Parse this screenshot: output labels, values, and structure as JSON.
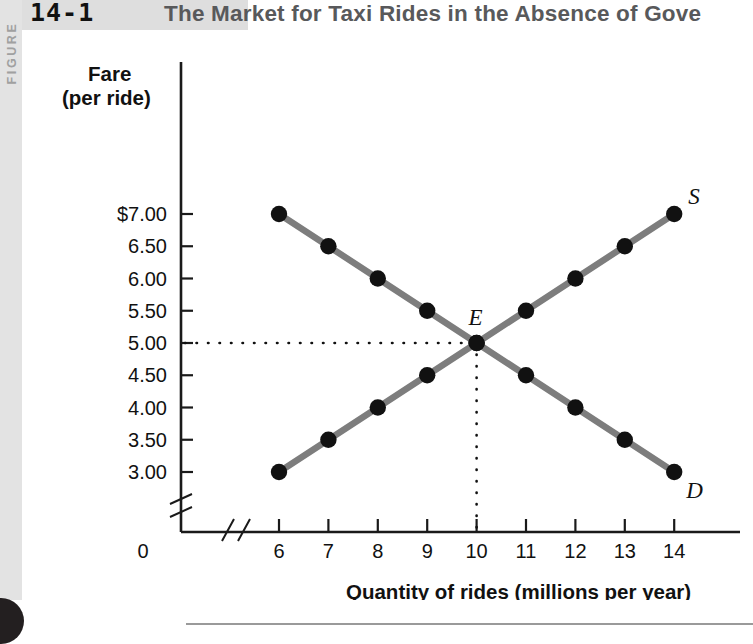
{
  "figure": {
    "number": "14-1",
    "rail_label": "FIGURE",
    "title": "The Market for Taxi Rides in the Absence of Gove"
  },
  "chart_data": {
    "type": "line",
    "title": "The Market for Taxi Rides in the Absence of Gove",
    "xlabel": "Quantity of rides (millions per year)",
    "ylabel": "Fare (per ride)",
    "ylabel_line1": "Fare",
    "ylabel_line2": "(per ride)",
    "x": [
      6,
      7,
      8,
      9,
      10,
      11,
      12,
      13,
      14
    ],
    "xtick_labels": [
      "6",
      "7",
      "8",
      "9",
      "10",
      "11",
      "12",
      "13",
      "14"
    ],
    "origin_label": "0",
    "ytick_values": [
      7.0,
      6.5,
      6.0,
      5.5,
      5.0,
      4.5,
      4.0,
      3.5,
      3.0
    ],
    "ytick_labels": [
      "$7.00",
      "6.50",
      "6.00",
      "5.50",
      "5.00",
      "4.50",
      "4.00",
      "3.50",
      "3.00"
    ],
    "xlim": [
      6,
      14
    ],
    "ylim": [
      3.0,
      7.0
    ],
    "grid": false,
    "axis_break_x": true,
    "axis_break_y": true,
    "legend": "inline-curve-labels",
    "series": [
      {
        "name": "Demand",
        "label": "D",
        "color": "#7d7d7d",
        "marker_color": "#111111",
        "values": [
          7.0,
          6.5,
          6.0,
          5.5,
          5.0,
          4.5,
          4.0,
          3.5,
          3.0
        ]
      },
      {
        "name": "Supply",
        "label": "S",
        "color": "#7d7d7d",
        "marker_color": "#111111",
        "values": [
          3.0,
          3.5,
          4.0,
          4.5,
          5.0,
          5.5,
          6.0,
          6.5,
          7.0
        ]
      }
    ],
    "annotations": [
      {
        "name": "equilibrium",
        "label": "E",
        "x": 10,
        "y": 5.0,
        "guides": "dotted-to-axes"
      }
    ]
  }
}
